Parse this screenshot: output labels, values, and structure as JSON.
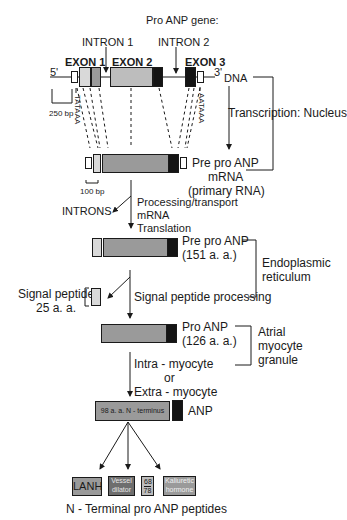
{
  "title": "Pro ANP gene:",
  "gene": {
    "intron1": "INTRON 1",
    "intron2": "INTRON 2",
    "exon1": "EXON 1",
    "exon2": "EXON 2",
    "exon3": "EXON 3",
    "five_prime": "5'",
    "three_prime": "3'",
    "dna": "DNA",
    "scale": "250 bp",
    "tataaa": "TATAAA",
    "aataaa": "AATAAA"
  },
  "steps": {
    "transcription": "Transcription: Nucleus",
    "mrna_line1": "Pre pro ANP",
    "mrna_line2": "mRNA",
    "mrna_line3": "(primary RNA)",
    "mrna_scale": "100 bp",
    "introns": "INTRONS",
    "processing_line1": "Processing/transport",
    "processing_line2": "mRNA",
    "processing_line3": "Translation",
    "prepro_line1": "Pre pro ANP",
    "prepro_line2": "(151 a. a.)",
    "er_line1": "Endoplasmic",
    "er_line2": "reticulum",
    "signal_line1": "Signal peptide",
    "signal_line2": "25 a. a.",
    "signal_processing": "Signal peptide processing",
    "proanp_line1": "Pro ANP",
    "proanp_line2": "(126 a. a.)",
    "granule_line1": "Atrial",
    "granule_line2": "myocyte",
    "granule_line3": "granule",
    "cleave_line1": "Intra - myocyte",
    "cleave_line2": "or",
    "cleave_line3": "Extra - myocyte",
    "nterm_box": "98 a. a. N - terminus",
    "anp": "ANP"
  },
  "peptides": {
    "lanh": "LANH",
    "vessel_line1": "Vessel",
    "vessel_line2": "dilator",
    "frac_top": "68",
    "frac_bottom": "78",
    "kaliuretic_line1": "Kaliuretic",
    "kaliuretic_line2": "hormone",
    "caption": "N - Terminal pro ANP peptides"
  },
  "colors": {
    "exon_light": "#d9d9d9",
    "exon_mid": "#9a9a9a",
    "exon_dark": "#141414",
    "peptide_dark": "#6e6e6e"
  }
}
